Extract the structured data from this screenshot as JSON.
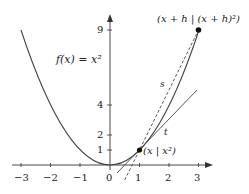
{
  "diagram": {
    "function_label": "f(x) = x²",
    "point_p_label": "(x | x²)",
    "point_q_label": "(x + h | (x + h)²)",
    "secant_label": "s",
    "tangent_label": "t",
    "x_ticks": [
      "−3",
      "−2",
      "−1",
      "0",
      "1",
      "2",
      "3"
    ],
    "y_ticks": [
      "1",
      "2",
      "4",
      "9"
    ],
    "colors": {
      "curve": "#444444",
      "axis": "#333333",
      "point": "#111111",
      "background": "#ffffff"
    }
  }
}
